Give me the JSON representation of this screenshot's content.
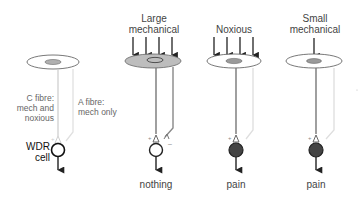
{
  "panels": [
    {
      "id": "wdr",
      "stimulus": "",
      "fibre_labels": {
        "c_fibre": [
          "C fibre:",
          "mech and",
          "noxious"
        ],
        "a_fibre": [
          "A fibre:",
          "mech only"
        ]
      },
      "cell_label": [
        "WDR",
        "cell"
      ],
      "output": ""
    },
    {
      "id": "large-mechanical",
      "stimulus": [
        "Large",
        "mechanical"
      ],
      "arrows": 4,
      "output": "nothing",
      "signs": {
        "c_synapse": "+",
        "a_synapse": "–"
      }
    },
    {
      "id": "noxious",
      "stimulus": [
        "Noxious"
      ],
      "arrows": 4,
      "output": "pain",
      "signs": {
        "c_synapse": "+"
      }
    },
    {
      "id": "small-mechanical",
      "stimulus": [
        "Small",
        "mechanical"
      ],
      "arrows": 1,
      "output": "pain",
      "signs": {
        "c_synapse": "+"
      }
    }
  ],
  "colors": {
    "c_fibre_active": "#777777",
    "c_fibre_idle": "#cccccc",
    "a_fibre_active": "#888888",
    "a_fibre_idle": "#dddddd",
    "skin_active": "#bdbdbd",
    "spot": "#a8a8a8",
    "cell_active": "#444444",
    "outline": "#333333"
  }
}
